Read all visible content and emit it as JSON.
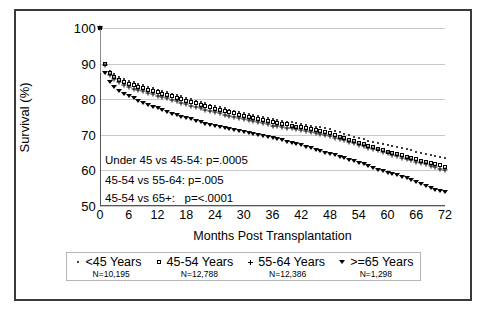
{
  "chart_data": {
    "type": "line",
    "title": "",
    "xlabel": "Months Post Transplantation",
    "ylabel": "Survival (%)",
    "xlim": [
      0,
      72
    ],
    "ylim": [
      50,
      100
    ],
    "xticks": [
      0,
      6,
      12,
      18,
      24,
      30,
      36,
      42,
      48,
      54,
      60,
      66,
      72
    ],
    "yticks": [
      50,
      60,
      70,
      80,
      90,
      100
    ],
    "grid": true,
    "legend_position": "bottom",
    "x": [
      0,
      1,
      2,
      3,
      4,
      5,
      6,
      7,
      8,
      9,
      10,
      11,
      12,
      13,
      14,
      15,
      16,
      17,
      18,
      19,
      20,
      21,
      22,
      23,
      24,
      25,
      26,
      27,
      28,
      29,
      30,
      31,
      32,
      33,
      34,
      35,
      36,
      37,
      38,
      39,
      40,
      41,
      42,
      43,
      44,
      45,
      46,
      47,
      48,
      49,
      50,
      51,
      52,
      53,
      54,
      55,
      56,
      57,
      58,
      59,
      60,
      61,
      62,
      63,
      64,
      65,
      66,
      67,
      68,
      69,
      70,
      71,
      72
    ],
    "series": [
      {
        "name": "<45 Years",
        "marker": "dot",
        "n": "N=10,195",
        "values": [
          100,
          90.2,
          88.0,
          87.0,
          86.3,
          85.7,
          85.2,
          84.7,
          84.3,
          83.9,
          83.5,
          83.1,
          82.7,
          82.3,
          82.0,
          81.6,
          81.2,
          80.8,
          80.4,
          80.0,
          79.6,
          79.2,
          78.8,
          78.5,
          78.1,
          77.8,
          77.5,
          77.1,
          76.8,
          76.5,
          76.2,
          75.9,
          75.6,
          75.3,
          75.0,
          74.7,
          74.4,
          74.1,
          73.9,
          73.7,
          73.5,
          73.2,
          73.0,
          72.8,
          72.6,
          72.3,
          72.1,
          71.8,
          71.5,
          71.1,
          70.7,
          70.3,
          69.9,
          69.5,
          69.1,
          68.7,
          68.3,
          68.0,
          67.7,
          67.4,
          67.1,
          66.8,
          66.5,
          66.2,
          65.9,
          65.6,
          65.3,
          65.0,
          64.7,
          64.4,
          64.1,
          63.8,
          63.5
        ]
      },
      {
        "name": "45-54 Years",
        "marker": "square",
        "n": "N=12,788",
        "values": [
          100,
          90.0,
          87.4,
          86.3,
          85.5,
          84.9,
          84.4,
          83.9,
          83.5,
          83.1,
          82.7,
          82.3,
          81.9,
          81.5,
          81.2,
          80.8,
          80.4,
          80.0,
          79.6,
          79.2,
          78.8,
          78.4,
          78.0,
          77.7,
          77.3,
          77.0,
          76.7,
          76.3,
          76.0,
          75.7,
          75.4,
          75.1,
          74.8,
          74.5,
          74.2,
          73.9,
          73.6,
          73.3,
          73.1,
          72.9,
          72.6,
          72.3,
          72.1,
          71.8,
          71.6,
          71.3,
          71.0,
          70.7,
          70.4,
          70.0,
          69.5,
          69.1,
          68.6,
          68.2,
          67.7,
          67.3,
          66.9,
          66.5,
          66.1,
          65.7,
          65.3,
          64.9,
          64.5,
          64.2,
          63.8,
          63.5,
          63.1,
          62.7,
          62.4,
          62.1,
          61.8,
          61.4,
          61.0
        ]
      },
      {
        "name": "55-64 Years",
        "marker": "plus",
        "n": "N=12,386",
        "values": [
          100,
          89.5,
          86.8,
          85.6,
          84.8,
          84.1,
          83.5,
          83.0,
          82.6,
          82.2,
          81.8,
          81.4,
          81.0,
          80.6,
          80.2,
          79.8,
          79.4,
          79.0,
          78.6,
          78.2,
          77.8,
          77.4,
          77.0,
          76.7,
          76.3,
          76.0,
          75.6,
          75.3,
          75.0,
          74.7,
          74.4,
          74.1,
          73.8,
          73.5,
          73.2,
          72.9,
          72.6,
          72.4,
          72.2,
          72.0,
          71.8,
          71.5,
          71.3,
          71.0,
          70.8,
          70.5,
          70.2,
          69.9,
          69.6,
          69.2,
          68.8,
          68.4,
          68.0,
          67.6,
          67.2,
          66.8,
          66.4,
          66.0,
          65.6,
          65.2,
          64.8,
          64.4,
          64.0,
          63.6,
          63.2,
          62.8,
          62.5,
          62.1,
          61.7,
          61.3,
          61.0,
          60.5,
          60.0
        ]
      },
      {
        "name": ">=65 Years",
        "marker": "triangle-down",
        "n": "N=1,298",
        "values": [
          100,
          87.5,
          84.8,
          83.4,
          82.4,
          81.6,
          80.9,
          80.2,
          79.6,
          79.0,
          78.4,
          77.9,
          77.4,
          76.9,
          76.4,
          75.9,
          75.5,
          75.1,
          74.7,
          74.3,
          73.9,
          73.5,
          73.1,
          72.8,
          72.5,
          72.2,
          71.9,
          71.6,
          71.3,
          71.1,
          70.9,
          70.6,
          70.3,
          70.0,
          69.7,
          69.4,
          69.1,
          68.8,
          68.4,
          68.0,
          67.7,
          67.3,
          67.0,
          66.6,
          66.2,
          65.8,
          65.4,
          65.0,
          64.6,
          64.2,
          63.8,
          63.4,
          63.0,
          62.6,
          62.2,
          61.7,
          61.2,
          60.7,
          60.2,
          59.8,
          59.4,
          59.0,
          58.6,
          58.2,
          57.8,
          57.3,
          56.8,
          56.2,
          55.6,
          55.0,
          54.5,
          54.2,
          54.0
        ]
      }
    ],
    "annotations": [
      "Under 45 vs 45-54: p=.0005",
      "45-54 vs 55-64: p=.005",
      "45-54 vs 65+:   p=<.0001"
    ]
  }
}
